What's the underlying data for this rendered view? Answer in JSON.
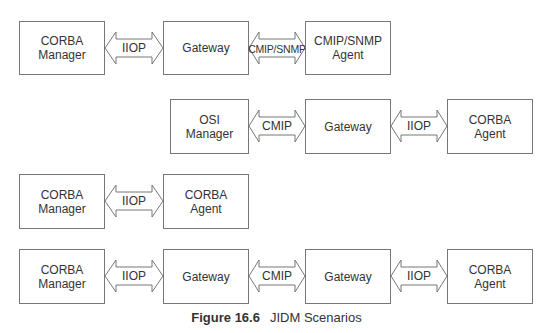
{
  "figure": {
    "number": "Figure 16.6",
    "title": "JIDM Scenarios"
  },
  "rows": [
    {
      "boxes": [
        {
          "line1": "CORBA",
          "line2": "Manager"
        },
        {
          "line1": "Gateway",
          "line2": ""
        },
        {
          "line1": "CMIP/SNMP",
          "line2": "Agent"
        }
      ],
      "arrows": [
        "IIOP",
        "CMIP/SNMP"
      ]
    },
    {
      "boxes": [
        {
          "line1": "OSI",
          "line2": "Manager"
        },
        {
          "line1": "Gateway",
          "line2": ""
        },
        {
          "line1": "CORBA",
          "line2": "Agent"
        }
      ],
      "arrows": [
        "CMIP",
        "IIOP"
      ]
    },
    {
      "boxes": [
        {
          "line1": "CORBA",
          "line2": "Manager"
        },
        {
          "line1": "CORBA",
          "line2": "Agent"
        }
      ],
      "arrows": [
        "IIOP"
      ]
    },
    {
      "boxes": [
        {
          "line1": "CORBA",
          "line2": "Manager"
        },
        {
          "line1": "Gateway",
          "line2": ""
        },
        {
          "line1": "Gateway",
          "line2": ""
        },
        {
          "line1": "CORBA",
          "line2": "Agent"
        }
      ],
      "arrows": [
        "IIOP",
        "CMIP",
        "IIOP"
      ]
    }
  ]
}
